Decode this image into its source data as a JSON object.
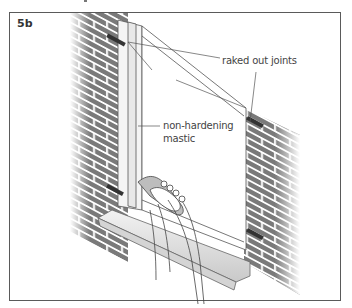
{
  "figure": {
    "label": "5b",
    "callouts": [
      {
        "id": "raked-out-joints",
        "text": "raked out joints"
      },
      {
        "id": "non-hardening-mastic",
        "line1": "non-hardening",
        "line2": "mastic"
      }
    ],
    "colors": {
      "brick": "#6e6e6e",
      "mortar": "#ffffff",
      "frame_border": "#5a5a5a",
      "line_art": "#555555",
      "sill_shadow": "#bdbdbd"
    }
  }
}
